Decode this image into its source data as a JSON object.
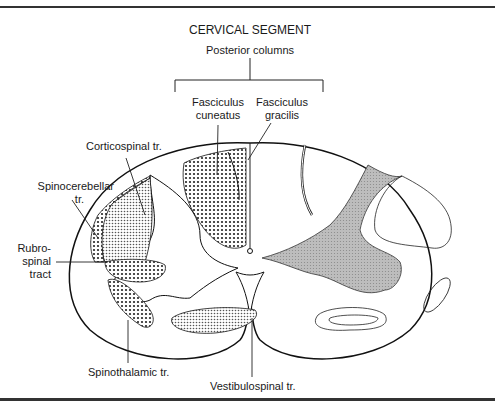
{
  "figure": {
    "title": "CERVICAL SEGMENT",
    "group_label": "Posterior columns",
    "labels": {
      "fasciculus_cuneatus": [
        "Fasciculus",
        "cuneatus"
      ],
      "fasciculus_gracilis": [
        "Fasciculus",
        "gracilis"
      ],
      "corticospinal": "Corticospinal tr.",
      "spinocerebellar": [
        "Spinocerebellar",
        "tr."
      ],
      "rubrospinal": [
        "Rubro-",
        "spinal",
        "tract"
      ],
      "spinothalamic": "Spinothalamic tr.",
      "vestibulospinal": "Vestibulospinal tr."
    }
  }
}
